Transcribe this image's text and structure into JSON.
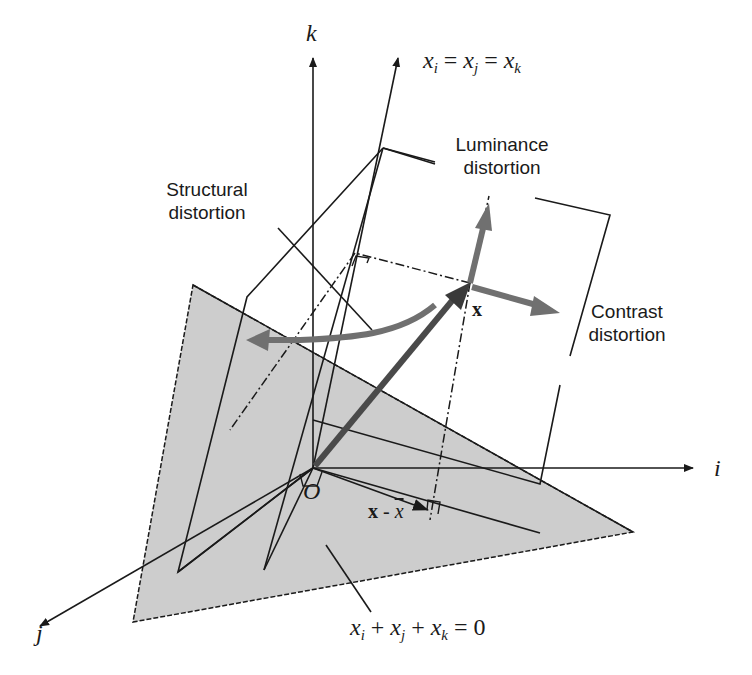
{
  "diagram": {
    "axes": {
      "k_label": "k",
      "i_label": "i",
      "j_label": "j",
      "origin_label": "O"
    },
    "diagonal": {
      "x": "x",
      "sub_i": "i",
      "sub_j": "j",
      "sub_k": "k",
      "eq": "="
    },
    "plane": {
      "x": "x",
      "sub_i": "i",
      "sub_j": "j",
      "sub_k": "k",
      "plus": "+",
      "eq": "=",
      "rhs": "0"
    },
    "labels": {
      "luminance_line1": "Luminance",
      "luminance_line2": "distortion",
      "structural_line1": "Structural",
      "structural_line2": "distortion",
      "contrast_line1": "Contrast",
      "contrast_line2": "distortion",
      "vector_x": "x",
      "vector_x_minus_mean_bold": "x",
      "vector_x_minus_mean_op": " - ",
      "vector_x_minus_mean_bar": "x"
    },
    "colors": {
      "plane_fill": "#cdcdcd",
      "arrow_gray": "#707070",
      "main_vector": "#4a4a4a",
      "line": "#1a1a1a"
    }
  }
}
